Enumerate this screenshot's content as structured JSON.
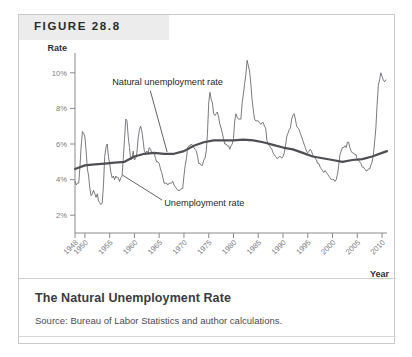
{
  "figure": {
    "tag": "FIGURE 28.8",
    "caption_title": "The Natural Unemployment Rate",
    "caption_source": "Source: Bureau of Labor Statistics and author calculations."
  },
  "chart_data": {
    "type": "line",
    "title": "The Natural Unemployment Rate",
    "xlabel": "Year",
    "ylabel": "Rate",
    "xlim": [
      1948,
      2011
    ],
    "ylim": [
      1,
      11
    ],
    "grid": false,
    "legend": "annotations",
    "y_ticks": [
      2,
      4,
      6,
      8,
      10
    ],
    "y_tick_labels": [
      "2%",
      "4%",
      "6%",
      "8%",
      "10%"
    ],
    "x_ticks": [
      1948,
      1950,
      1955,
      1960,
      1965,
      1970,
      1975,
      1980,
      1985,
      1990,
      1995,
      2000,
      2005,
      2010
    ],
    "x_tick_labels": [
      "1948",
      "1950",
      "1955",
      "1960",
      "1965",
      "1970",
      "1975",
      "1980",
      "1985",
      "1990",
      "1995",
      "2000",
      "2005",
      "2010"
    ],
    "annotations": [
      {
        "text": "Natural unemployment rate",
        "x": 1955.5,
        "y": 9.3
      },
      {
        "text": "Unemployment rate",
        "x": 1966.0,
        "y": 2.5
      }
    ],
    "series": [
      {
        "name": "Unemployment rate",
        "color": "#58585f",
        "width": 0.8,
        "x": [
          1948.0,
          1948.25,
          1948.5,
          1948.75,
          1949.0,
          1949.25,
          1949.5,
          1949.75,
          1950.0,
          1950.25,
          1950.5,
          1950.75,
          1951.0,
          1951.25,
          1951.5,
          1951.75,
          1952.0,
          1952.25,
          1952.5,
          1952.75,
          1953.0,
          1953.25,
          1953.5,
          1953.75,
          1954.0,
          1954.25,
          1954.5,
          1954.75,
          1955.0,
          1955.25,
          1955.5,
          1955.75,
          1956.0,
          1956.25,
          1956.5,
          1956.75,
          1957.0,
          1957.25,
          1957.5,
          1957.75,
          1958.0,
          1958.25,
          1958.5,
          1958.75,
          1959.0,
          1959.25,
          1959.5,
          1959.75,
          1960.0,
          1960.25,
          1960.5,
          1960.75,
          1961.0,
          1961.25,
          1961.5,
          1961.75,
          1962.0,
          1962.25,
          1962.5,
          1962.75,
          1963.0,
          1963.25,
          1963.5,
          1963.75,
          1964.0,
          1964.25,
          1964.5,
          1964.75,
          1965.0,
          1965.25,
          1965.5,
          1965.75,
          1966.0,
          1966.25,
          1966.5,
          1966.75,
          1967.0,
          1967.25,
          1967.5,
          1967.75,
          1968.0,
          1968.25,
          1968.5,
          1968.75,
          1969.0,
          1969.25,
          1969.5,
          1969.75,
          1970.0,
          1970.25,
          1970.5,
          1970.75,
          1971.0,
          1971.25,
          1971.5,
          1971.75,
          1972.0,
          1972.25,
          1972.5,
          1972.75,
          1973.0,
          1973.25,
          1973.5,
          1973.75,
          1974.0,
          1974.25,
          1974.5,
          1974.75,
          1975.0,
          1975.25,
          1975.5,
          1975.75,
          1976.0,
          1976.25,
          1976.5,
          1976.75,
          1977.0,
          1977.25,
          1977.5,
          1977.75,
          1978.0,
          1978.25,
          1978.5,
          1978.75,
          1979.0,
          1979.25,
          1979.5,
          1979.75,
          1980.0,
          1980.25,
          1980.5,
          1980.75,
          1981.0,
          1981.25,
          1981.5,
          1981.75,
          1982.0,
          1982.25,
          1982.5,
          1982.75,
          1983.0,
          1983.25,
          1983.5,
          1983.75,
          1984.0,
          1984.25,
          1984.5,
          1984.75,
          1985.0,
          1985.25,
          1985.5,
          1985.75,
          1986.0,
          1986.25,
          1986.5,
          1986.75,
          1987.0,
          1987.25,
          1987.5,
          1987.75,
          1988.0,
          1988.25,
          1988.5,
          1988.75,
          1989.0,
          1989.25,
          1989.5,
          1989.75,
          1990.0,
          1990.25,
          1990.5,
          1990.75,
          1991.0,
          1991.25,
          1991.5,
          1991.75,
          1992.0,
          1992.25,
          1992.5,
          1992.75,
          1993.0,
          1993.25,
          1993.5,
          1993.75,
          1994.0,
          1994.25,
          1994.5,
          1994.75,
          1995.0,
          1995.25,
          1995.5,
          1995.75,
          1996.0,
          1996.25,
          1996.5,
          1996.75,
          1997.0,
          1997.25,
          1997.5,
          1997.75,
          1998.0,
          1998.25,
          1998.5,
          1998.75,
          1999.0,
          1999.25,
          1999.5,
          1999.75,
          2000.0,
          2000.25,
          2000.5,
          2000.75,
          2001.0,
          2001.25,
          2001.5,
          2001.75,
          2002.0,
          2002.25,
          2002.5,
          2002.75,
          2003.0,
          2003.25,
          2003.5,
          2003.75,
          2004.0,
          2004.25,
          2004.5,
          2004.75,
          2005.0,
          2005.25,
          2005.5,
          2005.75,
          2006.0,
          2006.25,
          2006.5,
          2006.75,
          2007.0,
          2007.25,
          2007.5,
          2007.75,
          2008.0,
          2008.25,
          2008.5,
          2008.75,
          2009.0,
          2009.25,
          2009.5,
          2009.75,
          2010.0,
          2010.25,
          2010.5,
          2010.75
        ],
        "y": [
          3.9,
          3.7,
          3.8,
          3.8,
          4.7,
          5.9,
          6.7,
          6.6,
          6.4,
          5.6,
          4.6,
          4.2,
          3.5,
          3.1,
          3.2,
          3.4,
          3.2,
          3.0,
          3.2,
          2.8,
          2.7,
          2.6,
          2.7,
          3.7,
          5.3,
          5.8,
          6.0,
          5.3,
          4.9,
          4.4,
          4.1,
          4.2,
          4.0,
          4.2,
          4.1,
          4.1,
          3.9,
          4.1,
          4.2,
          5.2,
          6.3,
          7.4,
          7.3,
          6.4,
          5.8,
          5.1,
          5.2,
          5.6,
          5.1,
          5.2,
          5.5,
          6.3,
          6.8,
          7.0,
          6.7,
          6.2,
          5.6,
          5.5,
          5.6,
          5.5,
          5.8,
          5.7,
          5.5,
          5.5,
          5.5,
          5.2,
          5.0,
          5.0,
          4.9,
          4.6,
          4.4,
          4.1,
          3.8,
          3.8,
          3.8,
          3.7,
          3.8,
          3.8,
          3.8,
          3.9,
          3.7,
          3.6,
          3.5,
          3.4,
          3.4,
          3.4,
          3.5,
          3.5,
          4.2,
          4.8,
          5.2,
          5.8,
          5.9,
          5.9,
          6.0,
          5.9,
          5.8,
          5.7,
          5.6,
          5.3,
          4.9,
          4.9,
          4.8,
          4.8,
          5.1,
          5.2,
          5.6,
          6.6,
          8.3,
          8.9,
          8.5,
          8.3,
          7.7,
          7.6,
          7.7,
          7.8,
          7.5,
          7.1,
          6.9,
          6.6,
          6.3,
          6.0,
          6.0,
          5.9,
          5.9,
          5.7,
          5.9,
          6.0,
          6.3,
          7.3,
          7.7,
          7.5,
          7.4,
          7.4,
          7.4,
          8.3,
          8.8,
          9.4,
          9.9,
          10.7,
          10.4,
          10.1,
          9.4,
          8.5,
          7.9,
          7.4,
          7.3,
          7.3,
          7.3,
          7.2,
          7.1,
          7.2,
          7.2,
          7.0,
          6.9,
          6.2,
          6.0,
          5.9,
          5.8,
          5.7,
          5.5,
          5.4,
          5.3,
          5.2,
          5.2,
          5.3,
          5.3,
          5.2,
          5.3,
          5.5,
          5.9,
          6.4,
          6.6,
          6.8,
          6.9,
          7.4,
          7.6,
          7.7,
          7.4,
          7.0,
          6.9,
          6.8,
          6.6,
          6.4,
          6.2,
          6.0,
          5.8,
          5.6,
          5.5,
          5.6,
          5.7,
          5.6,
          5.4,
          5.3,
          5.2,
          5.1,
          4.9,
          4.9,
          4.7,
          4.6,
          4.5,
          4.4,
          4.5,
          4.4,
          4.3,
          4.2,
          4.1,
          4.0,
          4.0,
          4.0,
          3.9,
          4.0,
          4.3,
          4.8,
          5.4,
          5.6,
          5.8,
          5.8,
          5.9,
          5.8,
          6.1,
          6.1,
          5.8,
          5.6,
          5.5,
          5.5,
          5.4,
          5.4,
          5.1,
          5.1,
          5.0,
          4.9,
          4.7,
          4.7,
          4.6,
          4.5,
          4.5,
          4.6,
          4.6,
          4.8,
          5.0,
          5.4,
          6.1,
          6.9,
          8.2,
          9.3,
          9.6,
          10.0,
          9.8,
          9.6,
          9.5,
          9.6
        ]
      },
      {
        "name": "Natural unemployment rate",
        "color": "#4e4e55",
        "width": 2.2,
        "x": [
          1948,
          1950,
          1952,
          1954,
          1956,
          1958,
          1960,
          1962,
          1964,
          1966,
          1968,
          1970,
          1972,
          1974,
          1976,
          1978,
          1980,
          1982,
          1984,
          1986,
          1988,
          1990,
          1992,
          1994,
          1996,
          1998,
          2000,
          2002,
          2004,
          2006,
          2008,
          2010,
          2011
        ],
        "y": [
          4.6,
          4.8,
          4.85,
          4.9,
          4.95,
          5.0,
          5.3,
          5.45,
          5.5,
          5.45,
          5.45,
          5.6,
          5.9,
          6.1,
          6.2,
          6.2,
          6.2,
          6.25,
          6.2,
          6.1,
          5.95,
          5.8,
          5.7,
          5.5,
          5.3,
          5.2,
          5.1,
          5.0,
          5.1,
          5.15,
          5.3,
          5.5,
          5.6
        ]
      }
    ]
  },
  "axis": {
    "y_title": "Rate",
    "x_title": "Year"
  }
}
